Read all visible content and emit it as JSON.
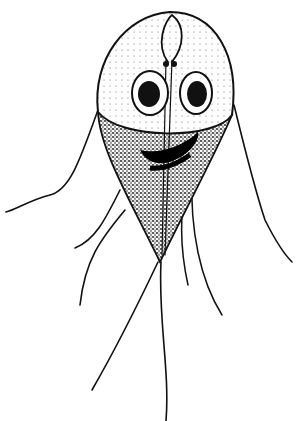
{
  "image": {
    "subject": "giardia-trophozoite-illustration",
    "style": "black-and-white stippled ink drawing",
    "colors": {
      "ink": "#111111",
      "background": "#ffffff"
    }
  }
}
